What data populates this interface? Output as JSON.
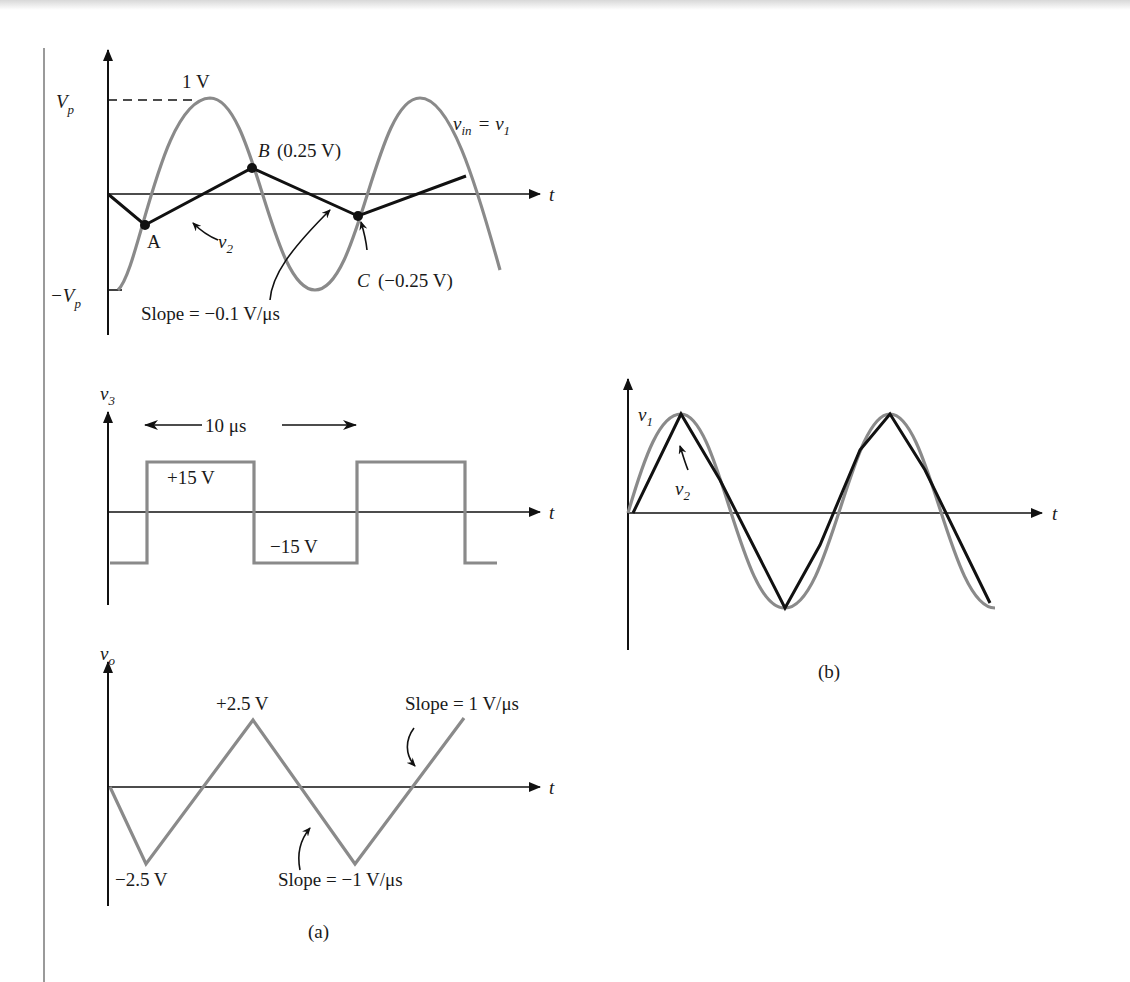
{
  "figure": {
    "panel_a_caption": "(a)",
    "panel_b_caption": "(b)",
    "colors": {
      "gray_trace": "#8a8a8a",
      "black_trace": "#111111",
      "axis": "#111111"
    }
  },
  "panel1": {
    "vp_label": "V",
    "vp_sub": "p",
    "neg_vp_label": "−V",
    "neg_vp_sub": "p",
    "peak_label": "1 V",
    "t_label": "t",
    "vin_label": "v",
    "vin_sub": "in",
    "vin_eq": "= v",
    "vin_eq_sub": "1",
    "point_a": "A",
    "point_b": "B",
    "point_b_value": "(0.25 V)",
    "point_c": "C",
    "point_c_value": "(−0.25 V)",
    "v2_label": "v",
    "v2_sub": "2",
    "slope_label": "Slope  =  −0.1 V/μs"
  },
  "panel2": {
    "axis_label": "v",
    "axis_sub": "3",
    "period_label": "10 μs",
    "high_label": "+15 V",
    "low_label": "−15 V",
    "t_label": "t"
  },
  "panel3": {
    "axis_label": "v",
    "axis_sub": "o",
    "peak_label": "+2.5 V",
    "trough_label": "−2.5 V",
    "slope_pos_label": "Slope  =  1 V/μs",
    "slope_neg_label": "Slope  =  −1 V/μs",
    "t_label": "t"
  },
  "panelb": {
    "v1_label": "v",
    "v1_sub": "1",
    "v2_label": "v",
    "v2_sub": "2",
    "t_label": "t"
  }
}
